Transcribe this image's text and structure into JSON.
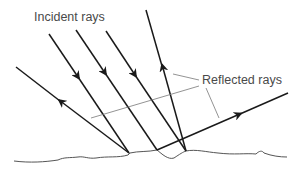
{
  "labels": {
    "incident": "Incident rays",
    "reflected": "Reflected rays"
  },
  "colors": {
    "ray": "#1a1a1a",
    "surface": "#555555",
    "leader": "#666666",
    "text": "#4a4a4a"
  },
  "rays": {
    "incident": [
      {
        "from": [
          49,
          34
        ],
        "to": [
          129,
          153
        ],
        "arrow_at": [
          78,
          77
        ]
      },
      {
        "from": [
          76,
          30
        ],
        "to": [
          157,
          150
        ],
        "arrow_at": [
          105,
          73
        ]
      },
      {
        "from": [
          106,
          31
        ],
        "to": [
          186,
          151
        ],
        "arrow_at": [
          135,
          75
        ]
      }
    ],
    "reflected": [
      {
        "from": [
          129,
          153
        ],
        "to": [
          16,
          67
        ],
        "arrow_at": [
          60,
          101
        ]
      },
      {
        "from": [
          186,
          151
        ],
        "to": [
          146,
          10
        ],
        "arrow_at": [
          162,
          66
        ]
      },
      {
        "from": [
          157,
          150
        ],
        "to": [
          288,
          93
        ],
        "arrow_at": [
          240,
          114
        ]
      }
    ]
  }
}
